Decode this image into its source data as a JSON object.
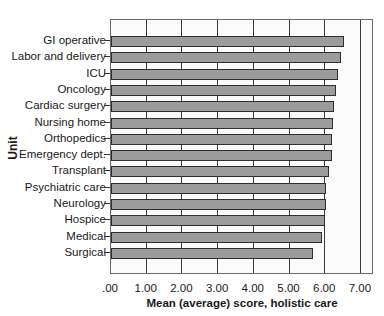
{
  "chart_data": {
    "type": "bar",
    "orientation": "horizontal",
    "title": "",
    "xlabel": "Mean (average) score, holistic care",
    "ylabel": "Unit",
    "xlim": [
      0,
      7.0
    ],
    "x_ticks": [
      ".00",
      "1.00",
      "2.00",
      "3.00",
      "4.00",
      "5.00",
      "6.00",
      "7.00"
    ],
    "grid": true,
    "legend": null,
    "categories": [
      "GI operative",
      "Labor and delivery",
      "ICU",
      "Oncology",
      "Cardiac surgery",
      "Nursing home",
      "Orthopedics",
      "Emergency dept.",
      "Transplant",
      "Psychiatric care",
      "Neurology",
      "Hospice",
      "Medical",
      "Surgical"
    ],
    "values": [
      6.52,
      6.45,
      6.37,
      6.3,
      6.24,
      6.21,
      6.2,
      6.19,
      6.11,
      6.03,
      6.02,
      5.99,
      5.91,
      5.66
    ],
    "colors": {
      "bar": "#9b9b9b",
      "bar_border": "#2e2e2e",
      "grid": "#3a3a3a"
    }
  }
}
